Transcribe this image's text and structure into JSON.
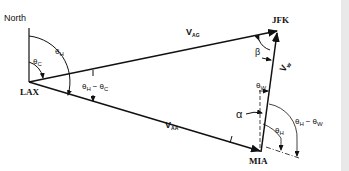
{
  "diagram": {
    "labels": {
      "north": "North",
      "lax": "LAX",
      "jfk": "JFK",
      "mia": "MIA",
      "theta": "θ",
      "sub_c": "C",
      "sub_h": "H",
      "sub_w": "W",
      "minus": "−",
      "v": "V",
      "sub_ag": "AG",
      "sub_aa": "AA",
      "v_w_sub": "w",
      "alpha": "α",
      "beta": "β"
    },
    "vectors": [
      {
        "name": "V_AG",
        "from": "LAX",
        "to": "JFK"
      },
      {
        "name": "V_AA",
        "from": "LAX",
        "to": "MIA"
      },
      {
        "name": "V_w",
        "from": "MIA",
        "to": "JFK"
      }
    ],
    "angles": [
      "θ_C",
      "θ_H",
      "θ_H − θ_C",
      "θ_W",
      "θ_H",
      "θ_H − θ_W",
      "α",
      "β"
    ],
    "colors": {
      "ink": "#111111",
      "background": "#ffffff"
    }
  }
}
